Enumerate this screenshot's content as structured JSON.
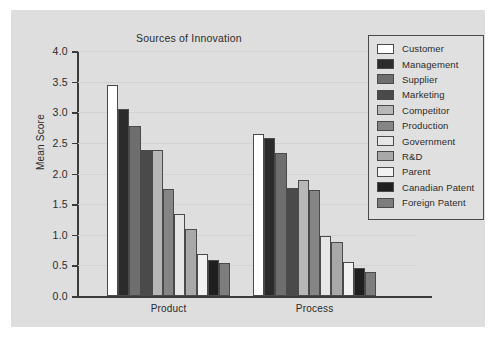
{
  "figure": {
    "background_color": "#dedede",
    "page_background": "#ffffff",
    "frame_color": "#4a4a4a"
  },
  "chart_data": {
    "type": "bar",
    "title": "Sources of Innovation",
    "xlabel": "",
    "ylabel": "Mean Score",
    "ylim": [
      0.0,
      4.0
    ],
    "ytick_labels": [
      "0.0",
      "0.5",
      "1.0",
      "1.5",
      "2.0",
      "2.5",
      "3.0",
      "3.5",
      "4.0"
    ],
    "ytick_values": [
      0.0,
      0.5,
      1.0,
      1.5,
      2.0,
      2.5,
      3.0,
      3.5,
      4.0
    ],
    "grid": true,
    "legend_position": "top-right",
    "categories": [
      "Product",
      "Process"
    ],
    "series": [
      {
        "name": "Customer",
        "color": "#ffffff",
        "values": [
          3.45,
          2.65
        ]
      },
      {
        "name": "Management",
        "color": "#2b2b2b",
        "values": [
          3.05,
          2.58
        ]
      },
      {
        "name": "Supplier",
        "color": "#6e6e6e",
        "values": [
          2.78,
          2.33
        ]
      },
      {
        "name": "Marketing",
        "color": "#4a4a4a",
        "values": [
          2.39,
          1.77
        ]
      },
      {
        "name": "Competitor",
        "color": "#b7b7b7",
        "values": [
          2.39,
          1.89
        ]
      },
      {
        "name": "Production",
        "color": "#858585",
        "values": [
          1.74,
          1.73
        ]
      },
      {
        "name": "Government",
        "color": "#e6e6e6",
        "values": [
          1.34,
          0.98
        ]
      },
      {
        "name": "R&D",
        "color": "#a8a8a8",
        "values": [
          1.09,
          0.88
        ]
      },
      {
        "name": "Parent",
        "color": "#f2f2f2",
        "values": [
          0.68,
          0.56
        ]
      },
      {
        "name": "Canadian Patent",
        "color": "#1f1f1f",
        "values": [
          0.58,
          0.45
        ]
      },
      {
        "name": "Foreign Patent",
        "color": "#7d7d7d",
        "values": [
          0.54,
          0.4
        ]
      }
    ]
  }
}
